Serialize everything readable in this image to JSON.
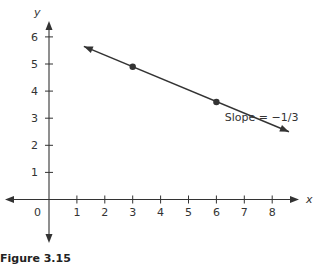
{
  "chart_data": {
    "type": "line",
    "title": "",
    "xlabel": "x",
    "ylabel": "y",
    "x_ticks": [
      1,
      2,
      3,
      4,
      5,
      6,
      7,
      8
    ],
    "y_ticks": [
      1,
      2,
      3,
      4,
      5,
      6
    ],
    "origin_label": "0",
    "xlim": [
      -1.5,
      9
    ],
    "ylim": [
      -1.5,
      7
    ],
    "grid": false,
    "series": [
      {
        "name": "line",
        "points": [
          {
            "x": 3,
            "y": 4.9
          },
          {
            "x": 6,
            "y": 3.6
          }
        ],
        "line_extent": {
          "x_start": 1.25,
          "y_start": 5.65,
          "x_end": 8.6,
          "y_end": 2.5
        },
        "arrows_both_ends": true
      }
    ],
    "annotations": [
      {
        "text": "Slope = −1/3",
        "x": 6.3,
        "y": 2.9
      }
    ]
  },
  "caption": "Figure 3.15",
  "colors": {
    "line": "#333333",
    "axis": "#333333",
    "text": "#333333"
  }
}
